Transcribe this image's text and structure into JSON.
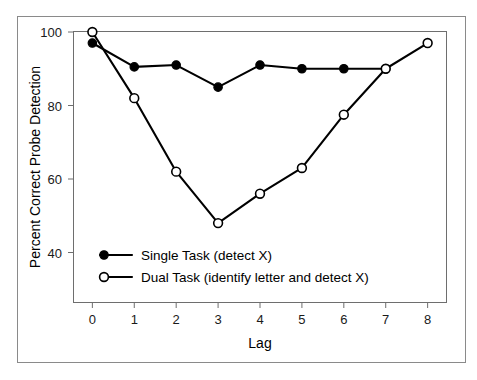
{
  "chart_data": {
    "type": "line",
    "title": "",
    "xlabel": "Lag",
    "ylabel": "Percent Correct Probe Detection",
    "x": [
      0,
      1,
      2,
      3,
      4,
      5,
      6,
      7,
      8
    ],
    "xlim": [
      -0.45,
      8.45
    ],
    "ylim": [
      33,
      102
    ],
    "xticks": [
      "0",
      "1",
      "2",
      "3",
      "4",
      "5",
      "6",
      "7",
      "8"
    ],
    "yticks": [
      "40",
      "60",
      "80",
      "100"
    ],
    "ytick_values": [
      40,
      60,
      80,
      100
    ],
    "grid": false,
    "legend_position": "lower-left-inside",
    "series": [
      {
        "name": "Single Task (detect X)",
        "marker": "filled-circle",
        "x": [
          0,
          1,
          2,
          3,
          4,
          5,
          6,
          7
        ],
        "values": [
          97,
          90.5,
          91,
          85,
          91,
          90,
          90,
          90
        ]
      },
      {
        "name": "Dual Task (identify letter and detect X)",
        "marker": "open-circle",
        "x": [
          0,
          1,
          2,
          3,
          4,
          5,
          6,
          7,
          8
        ],
        "values": [
          100,
          82,
          62,
          48,
          56,
          63,
          77.5,
          90,
          97
        ]
      }
    ]
  },
  "legend": {
    "items": [
      {
        "label": "Single Task (detect X)",
        "marker": "filled-circle"
      },
      {
        "label": "Dual Task (identify letter and detect X)",
        "marker": "open-circle"
      }
    ]
  },
  "axes": {
    "y_title": "Percent Correct Probe Detection",
    "x_title": "Lag",
    "y_tick_labels": [
      "100",
      "80",
      "60",
      "40"
    ],
    "x_tick_labels": [
      "0",
      "1",
      "2",
      "3",
      "4",
      "5",
      "6",
      "7",
      "8"
    ]
  },
  "colors": {
    "line": "#000000",
    "marker_fill_single": "#000000",
    "marker_fill_dual": "#ffffff",
    "frame": "#6e6e6e",
    "outer_frame": "#8a8a8a",
    "background": "#ffffff",
    "text": "#000000"
  }
}
